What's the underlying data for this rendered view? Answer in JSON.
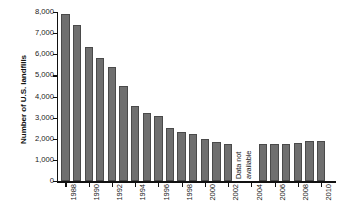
{
  "chart_data": {
    "type": "bar",
    "title": "",
    "xlabel": "",
    "ylabel": "Number of U.S. landfills",
    "ylim": [
      0,
      8000
    ],
    "ytick_values": [
      0,
      1000,
      2000,
      3000,
      4000,
      5000,
      6000,
      7000,
      8000
    ],
    "ytick_labels": [
      "0",
      "1,000",
      "2,000",
      "3,000",
      "4,000",
      "5,000",
      "6,000",
      "7,000",
      "8,000"
    ],
    "grid": false,
    "legend": "none",
    "bar_color": "#6f6f6f",
    "bar_edge_color": "#4a4a4a",
    "axis_color": "#111111",
    "categories": [
      "1988",
      "1989",
      "1990",
      "1991",
      "1992",
      "1993",
      "1994",
      "1995",
      "1996",
      "1997",
      "1998",
      "1999",
      "2000",
      "2001",
      "2002",
      "2003",
      "2004",
      "2005",
      "2006",
      "2007",
      "2008",
      "2009",
      "2010"
    ],
    "values": [
      7924,
      7379,
      6326,
      5812,
      5386,
      4482,
      3558,
      3197,
      3091,
      2514,
      2314,
      2216,
      1967,
      1858,
      1767,
      null,
      null,
      1754,
      1754,
      1738,
      1812,
      1908,
      1908
    ],
    "xtick_labels_shown": [
      "1988",
      "1990",
      "1992",
      "1994",
      "1996",
      "1998",
      "2000",
      "2002",
      "2004",
      "2006",
      "2008",
      "2010"
    ],
    "annotations": [
      {
        "text_line_1": "Data not",
        "text_line_2": "available",
        "at_category": "2004",
        "orientation": "vertical"
      }
    ]
  },
  "annotation": {
    "line1": "Data not",
    "line2": "available"
  }
}
